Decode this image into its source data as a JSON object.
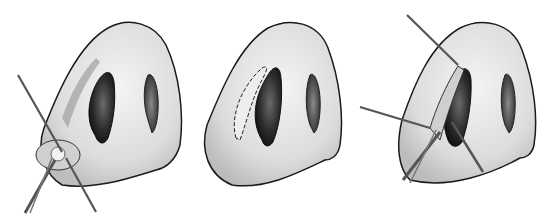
{
  "figure": {
    "panels": [
      {
        "id": "panel-1",
        "content": "Nose with shaded strip along left nostril rim; two crossing instruments retracting tissue at the left alar base"
      },
      {
        "id": "panel-2",
        "content": "Nose with dashed incision line outlining a crescent along the left nostril rim"
      },
      {
        "id": "panel-3",
        "content": "Nose with incision opened; three instruments (two hooks and forceps) retracting the flap at the left nostril"
      }
    ],
    "colors": {
      "background": "#ffffff",
      "skin": "#e6e6e6",
      "skin_shadow": "#b8b8b8",
      "nostril": "#3a3a3a",
      "outline": "#1a1a1a",
      "instrument": "#555555"
    }
  }
}
